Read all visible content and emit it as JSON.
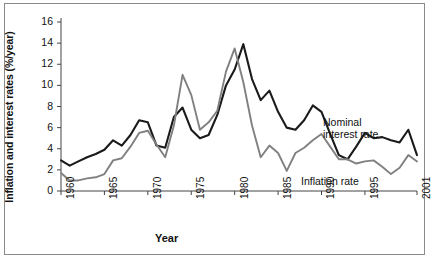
{
  "chart_data": {
    "type": "line",
    "title": "",
    "xlabel": "Year",
    "ylabel": "Inflation and interest rates (%/year)",
    "xlim": [
      1960,
      2001
    ],
    "ylim": [
      0,
      16
    ],
    "ytick_labels": [
      "0",
      "2",
      "4",
      "6",
      "8",
      "10",
      "12",
      "14",
      "16"
    ],
    "ytick_values": [
      0,
      2,
      4,
      6,
      8,
      10,
      12,
      14,
      16
    ],
    "xtick_labels": [
      "1960",
      "1965",
      "1970",
      "1975",
      "1980",
      "1985",
      "1990",
      "1995",
      "2001"
    ],
    "xtick_values": [
      1960,
      1965,
      1970,
      1975,
      1980,
      1985,
      1990,
      1995,
      2001
    ],
    "grid": false,
    "legend_position": "inline-annotations",
    "x": [
      1960,
      1961,
      1962,
      1963,
      1964,
      1965,
      1966,
      1967,
      1968,
      1969,
      1970,
      1971,
      1972,
      1973,
      1974,
      1975,
      1976,
      1977,
      1978,
      1979,
      1980,
      1981,
      1982,
      1983,
      1984,
      1985,
      1986,
      1987,
      1988,
      1989,
      1990,
      1991,
      1992,
      1993,
      1994,
      1995,
      1996,
      1997,
      1998,
      1999,
      2000,
      2001
    ],
    "series": [
      {
        "name": "Nominal interest rate",
        "color": "#1a1a1a",
        "values": [
          2.9,
          2.4,
          2.8,
          3.2,
          3.5,
          3.9,
          4.8,
          4.3,
          5.3,
          6.7,
          6.5,
          4.3,
          4.1,
          7.0,
          7.9,
          5.8,
          5.0,
          5.3,
          7.2,
          10.0,
          11.5,
          13.9,
          10.6,
          8.6,
          9.5,
          7.5,
          6.0,
          5.8,
          6.7,
          8.1,
          7.5,
          5.4,
          3.4,
          3.0,
          4.2,
          5.5,
          5.0,
          5.1,
          4.8,
          4.6,
          5.8,
          3.4
        ]
      },
      {
        "name": "Inflation rate",
        "color": "#808080",
        "values": [
          1.7,
          1.0,
          1.0,
          1.2,
          1.3,
          1.6,
          2.9,
          3.1,
          4.2,
          5.5,
          5.7,
          4.4,
          3.2,
          6.2,
          11.0,
          9.1,
          5.8,
          6.5,
          7.6,
          11.3,
          13.5,
          10.3,
          6.2,
          3.2,
          4.3,
          3.6,
          1.9,
          3.6,
          4.1,
          4.8,
          5.4,
          4.2,
          3.0,
          3.0,
          2.6,
          2.8,
          2.9,
          2.3,
          1.6,
          2.2,
          3.4,
          2.8
        ]
      }
    ],
    "annotations": [
      {
        "name": "nominal-interest-rate",
        "line1": "Nominal",
        "line2": "interest rate"
      },
      {
        "name": "inflation-rate",
        "line1": "Inflation rate",
        "line2": ""
      }
    ]
  }
}
